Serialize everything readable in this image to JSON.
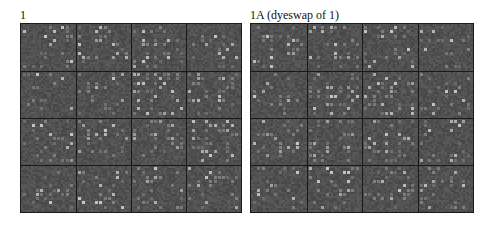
{
  "figure": {
    "panels": [
      {
        "id": "panel-1",
        "title": "1",
        "grid": {
          "rows": 4,
          "cols": 4,
          "x": 20,
          "y": 23,
          "width": 222,
          "height": 190
        },
        "seed": 17
      },
      {
        "id": "panel-1a",
        "title": "1A (dyeswap of 1)",
        "grid": {
          "rows": 4,
          "cols": 4,
          "x": 250,
          "y": 23,
          "width": 224,
          "height": 190
        },
        "seed": 17
      }
    ],
    "colors": {
      "background": "#4d4d4d",
      "grid_line": "#1a1a1a",
      "spot_dim": "#5c5c5c",
      "spot_bright": "#b8b8b8",
      "title_text": "#111111"
    },
    "spot_layout": {
      "spot_cols": 12,
      "spot_rows": 10,
      "spot_size": 3
    }
  }
}
